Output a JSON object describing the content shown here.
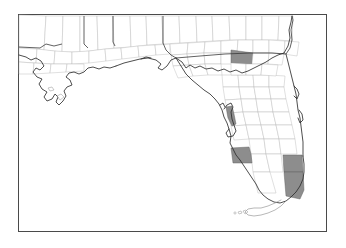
{
  "figure": {
    "type": "choropleth-county-map",
    "region": "Florida and Gulf Coast",
    "frame": {
      "x": 18,
      "y": 14,
      "width": 309,
      "height": 218,
      "border_color": "#4a4a4a"
    },
    "background_color": "#ffffff"
  },
  "legend_colors": {
    "highlight_fill": "#8d8d8d",
    "county_fill": "#ffffff",
    "county_border": "#b9b9b9",
    "state_border": "#3a3a3a",
    "coastline": "#2e2e2e",
    "keys": "#9a9a9a"
  },
  "highlighted_counties": [
    {
      "name": "Orange",
      "state": "FL",
      "position": "central-peninsula",
      "fill": "#8d8d8d"
    },
    {
      "name": "Pinellas",
      "state": "FL",
      "position": "tampa-bay-west-coast",
      "fill": "#8d8d8d"
    },
    {
      "name": "Lee",
      "state": "FL",
      "position": "southwest-coast",
      "fill": "#8d8d8d"
    },
    {
      "name": "Broward",
      "state": "FL",
      "position": "southeast-coast",
      "fill": "#8d8d8d"
    },
    {
      "name": "Miami-Dade",
      "state": "FL",
      "position": "southeast-tip",
      "fill": "#8d8d8d"
    }
  ],
  "map_features": {
    "states_shown": [
      "Louisiana",
      "Mississippi",
      "Alabama",
      "Georgia",
      "Florida"
    ],
    "keys_label": "Florida Keys",
    "county_count_shaded": 5
  },
  "labels": {
    "title": "",
    "caption": ""
  }
}
